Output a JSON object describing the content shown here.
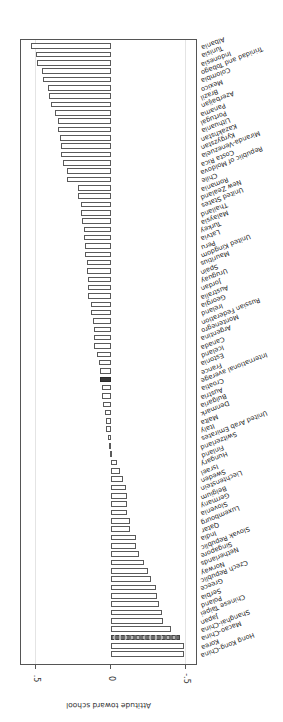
{
  "chart_data": {
    "type": "bar",
    "orientation": "horizontal",
    "image_rotation_deg": 180,
    "title": "",
    "xlabel": "Attitude toward school",
    "ylabel": "",
    "xlim": [
      -0.6,
      0.6
    ],
    "xticks": [
      -0.5,
      0,
      0.5
    ],
    "xtick_labels": [
      "-.5",
      "0",
      ".5"
    ],
    "grid": true,
    "legend": null,
    "highlight": {
      "International average": "dark fill",
      "Macao-China": "dashed fill"
    },
    "categories": [
      "Hong Kong-China",
      "Korea",
      "Macao-China",
      "Shanghai-China",
      "Japan",
      "Chinese Taipei",
      "Poland",
      "Serbia",
      "Greece",
      "Czech Republic",
      "Norway",
      "Netherlands",
      "Singapore",
      "Slovak Republic",
      "India",
      "Qatar",
      "Luxembourg",
      "Slovenia",
      "Germany",
      "Belgium",
      "Liechtenstein",
      "Sweden",
      "Israel",
      "Hungary",
      "Finland",
      "Switzerland",
      "United Arab Emirates",
      "Italy",
      "Malta",
      "Denmark",
      "Bulgaria",
      "Austria",
      "Croatia",
      "International average",
      "France",
      "Estonia",
      "Iceland",
      "Canada",
      "Argentina",
      "Montenegro",
      "Russian Federation",
      "Ireland",
      "Georgia",
      "Australia",
      "Jordan",
      "Uruguay",
      "Spain",
      "Mauritius",
      "United Kingdom",
      "Peru",
      "Latvia",
      "Turkey",
      "Malaysia",
      "Thailand",
      "United States",
      "New Zealand",
      "Romania",
      "Chile",
      "Republic of Moldova",
      "Costa Rica",
      "Miranda-Venezuela",
      "Kyrgyzstan",
      "Kazakhstan",
      "Lithuania",
      "Portugal",
      "Panama",
      "Azerbaijan",
      "Brazil",
      "Mexico",
      "Colombia",
      "Trinidad and Tobago",
      "Indonesia",
      "Tunisia",
      "Albania"
    ],
    "values": [
      -0.49,
      -0.49,
      -0.46,
      -0.4,
      -0.35,
      -0.34,
      -0.32,
      -0.31,
      -0.3,
      -0.27,
      -0.25,
      -0.22,
      -0.19,
      -0.17,
      -0.17,
      -0.13,
      -0.13,
      -0.11,
      -0.11,
      -0.11,
      -0.1,
      -0.08,
      -0.06,
      -0.04,
      -0.01,
      0.01,
      0.02,
      0.03,
      0.03,
      0.04,
      0.05,
      0.06,
      0.06,
      0.07,
      0.07,
      0.08,
      0.09,
      0.11,
      0.11,
      0.11,
      0.12,
      0.13,
      0.13,
      0.15,
      0.15,
      0.15,
      0.16,
      0.16,
      0.17,
      0.17,
      0.18,
      0.18,
      0.19,
      0.2,
      0.2,
      0.22,
      0.22,
      0.29,
      0.29,
      0.32,
      0.33,
      0.33,
      0.34,
      0.35,
      0.35,
      0.37,
      0.4,
      0.41,
      0.42,
      0.45,
      0.46,
      0.49,
      0.5,
      0.53
    ]
  },
  "axis": {
    "title": "Attitude toward school",
    "ticks": [
      "-.5",
      "0",
      ".5"
    ]
  }
}
